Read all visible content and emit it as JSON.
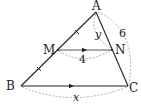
{
  "diagram": {
    "type": "geometry-triangle-midsegment",
    "points": {
      "A": "A",
      "B": "B",
      "C": "C",
      "M": "M",
      "N": "N"
    },
    "segments": [
      {
        "name": "AB",
        "note": "M is midpoint (tick marks on AM and MB)"
      },
      {
        "name": "AC"
      },
      {
        "name": "BC",
        "note": "parallel arrow"
      },
      {
        "name": "MN",
        "note": "parallel arrow"
      }
    ],
    "measures": {
      "MN": "4",
      "AN": "y",
      "AC": "6",
      "BC": "x"
    }
  }
}
